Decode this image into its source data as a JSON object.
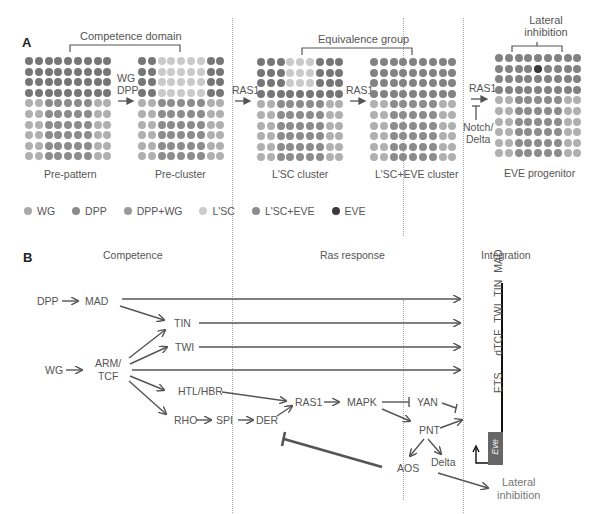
{
  "panel_a": {
    "letter": "A",
    "brackets": {
      "competence_domain": "Competence domain",
      "equivalence_group": "Equivalence group",
      "lateral_inhibition_line1": "Lateral",
      "lateral_inhibition_line2": "inhibition"
    },
    "transitions": {
      "t1_line1": "WG",
      "t1_line2": "DPP",
      "t2": "RAS1",
      "t3": "RAS1",
      "t4": "RAS1",
      "t4_inhibitor_line1": "Notch/",
      "t4_inhibitor_line2": "Delta"
    },
    "stages": [
      {
        "label": "Pre-pattern",
        "grid": [
          "DDDDDDDDD",
          "DDDDDDDDD",
          "DDDDDDDDD",
          "DDDDDDDDD",
          "WWMMMMMWW",
          "WWMMMMMWW",
          "WWMMMMMWW",
          "WWMMMMMWW",
          "WWMMMMMWW",
          "WWMMMMMWW"
        ]
      },
      {
        "label": "Pre-cluster",
        "grid": [
          "DDLLLLLDD",
          "DDLLLLLDD",
          "DDLLLLLDD",
          "DDLLLLLDD",
          "WWMMMMMWW",
          "WWMMMMMWW",
          "WWMMMMMWW",
          "WWMMMMMWW",
          "WWMMMMMWW",
          "WWMMMMMWW"
        ]
      },
      {
        "label": "L'SC cluster",
        "grid": [
          "DDDLLLDDD",
          "DDDLLLDDD",
          "DDDLLLDDD",
          "DDDDDDDDD",
          "WWMMMMMWW",
          "WWMMMMMWW",
          "WWMMMMMWW",
          "WWMMMMMWW",
          "WWMMMMMWW",
          "WWMMMMMWW"
        ]
      },
      {
        "label": "L'SC+EVE cluster",
        "grid": [
          "EEEEEEEEE",
          "EEEEEEEEE",
          "EEEEEEEEE",
          "EEEEEEEEE",
          "WWMMMMMWW",
          "WWMMMMMWW",
          "WWMMMMMWW",
          "WWMMMMMWW",
          "WWMMMMMWW",
          "WWMMMMMWW"
        ]
      },
      {
        "label": "EVE progenitor",
        "grid": [
          "EEEEEEEEE",
          "EEEEXEEEE",
          "EEEEEEEEE",
          "EEEEEEEEE",
          "WWMMMMMWW",
          "WWMMMMMWW",
          "WWMMMMMWW",
          "WWMMMMMWW",
          "WWMMMMMWW",
          "WWMMMMMWW"
        ]
      }
    ],
    "dot_colors": {
      "D": "#767676",
      "W": "#b0b0b0",
      "M": "#8c8c8c",
      "L": "#cacaca",
      "E": "#828282",
      "X": "#383838"
    },
    "legend": [
      {
        "label": "WG",
        "color": "#a9a9a9"
      },
      {
        "label": "DPP",
        "color": "#8a8a8a"
      },
      {
        "label": "DPP+WG",
        "color": "#999999"
      },
      {
        "label": "L'SC",
        "color": "#cccccc"
      },
      {
        "label": "L'SC+EVE",
        "color": "#8c8c8c"
      },
      {
        "label": "EVE",
        "color": "#3a3a3a"
      }
    ]
  },
  "panel_b": {
    "letter": "B",
    "sections": {
      "competence": "Competence",
      "ras_response": "Ras response",
      "integration": "Integration"
    },
    "nodes": {
      "dpp": "DPP",
      "mad": "MAD",
      "tin": "TIN",
      "twi": "TWI",
      "wg": "WG",
      "arm_line1": "ARM/",
      "arm_line2": "TCF",
      "htl": "HTL/HBR",
      "rho": "RHO",
      "spi": "SPI",
      "der": "DER",
      "ras1": "RAS1",
      "mapk": "MAPK",
      "yan": "YAN",
      "pnt": "PNT",
      "aos": "AOS",
      "delta": "Delta",
      "lateral_line1": "Lateral",
      "lateral_line2": "inhibition"
    },
    "enhancer": {
      "sites": [
        "MAD",
        "TIN",
        "TWI",
        "dTCF",
        "ETS"
      ],
      "gene": "Eve"
    }
  }
}
